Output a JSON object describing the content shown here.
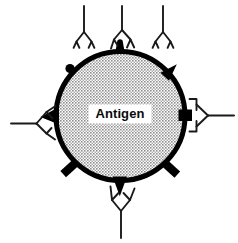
{
  "figure": {
    "name": "antigen-antibody-epitope-diagram",
    "type": "biology-schematic",
    "background_color": "#ffffff"
  },
  "antigen": {
    "label": "Antigen",
    "shape": "circle",
    "center_x": 120.5,
    "center_y": 116,
    "radius": 67,
    "fill_color": "#b3b3b3",
    "fill_pattern": "stipple-halftone",
    "outline_color": "#000000",
    "outline_width": 5,
    "label_box_fill": "#ffffff",
    "label_text_color": "#0a0a0a"
  },
  "epitopes": [
    {
      "id": "epitope-knob-upper-left",
      "shape": "round-knob",
      "angle_deg": 138,
      "color": "#000000",
      "bound": false
    },
    {
      "id": "epitope-knob-top",
      "shape": "round-knob",
      "angle_deg": 94,
      "color": "#000000",
      "bound": true,
      "bound_by": "antibody-top-center"
    },
    {
      "id": "epitope-spike-upper-right",
      "shape": "triangular-spike",
      "angle_deg": 46,
      "color": "#000000",
      "bound": false
    },
    {
      "id": "epitope-block-right",
      "shape": "rectangular-block",
      "angle_deg": 2,
      "color": "#000000",
      "bound": true,
      "bound_by": "antibody-right"
    },
    {
      "id": "epitope-bar-lower-right",
      "shape": "rectangular-bar",
      "angle_deg": -40,
      "color": "#000000",
      "bound": false
    },
    {
      "id": "epitope-wedge-bottom",
      "shape": "triangular-wedge",
      "angle_deg": -92,
      "color": "#000000",
      "bound": true,
      "bound_by": "antibody-bottom"
    },
    {
      "id": "epitope-bar-lower-left",
      "shape": "rectangular-bar",
      "angle_deg": -140,
      "color": "#000000",
      "bound": false
    },
    {
      "id": "epitope-wedge-left",
      "shape": "triangular-wedge",
      "angle_deg": 184,
      "color": "#000000",
      "bound": true,
      "bound_by": "antibody-left"
    }
  ],
  "antibodies": [
    {
      "id": "antibody-top-left",
      "shape": "Y",
      "orientation_deg": 0,
      "bound": false,
      "stroke_color": "#1a1a1a",
      "fill_color": "#ffffff"
    },
    {
      "id": "antibody-top-center",
      "shape": "Y",
      "orientation_deg": 0,
      "bound": true,
      "binds_epitope": "epitope-knob-top",
      "stroke_color": "#1a1a1a",
      "fill_color": "#ffffff"
    },
    {
      "id": "antibody-top-right",
      "shape": "Y",
      "orientation_deg": 0,
      "bound": false,
      "stroke_color": "#1a1a1a",
      "fill_color": "#ffffff"
    },
    {
      "id": "antibody-right",
      "shape": "Y",
      "orientation_deg": 90,
      "bound": true,
      "binds_epitope": "epitope-block-right",
      "stroke_color": "#1a1a1a",
      "fill_color": "#ffffff"
    },
    {
      "id": "antibody-left",
      "shape": "Y",
      "orientation_deg": -90,
      "bound": true,
      "binds_epitope": "epitope-wedge-left",
      "stroke_color": "#1a1a1a",
      "fill_color": "#ffffff"
    },
    {
      "id": "antibody-bottom",
      "shape": "Y",
      "orientation_deg": 180,
      "bound": true,
      "binds_epitope": "epitope-wedge-bottom",
      "stroke_color": "#1a1a1a",
      "fill_color": "#ffffff"
    }
  ]
}
